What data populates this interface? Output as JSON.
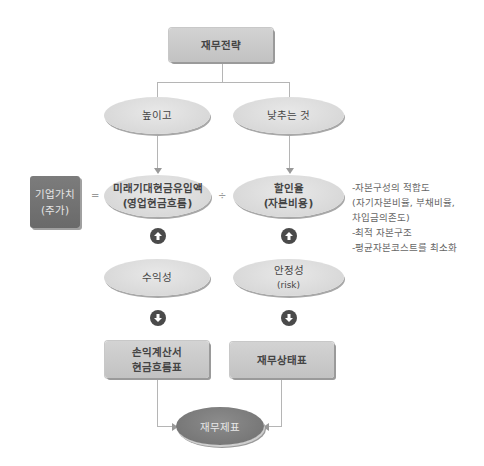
{
  "diagram": {
    "top": {
      "label": "재무전략"
    },
    "branches": {
      "left": {
        "label": "높이고"
      },
      "right": {
        "label": "낮추는 것"
      }
    },
    "equation": {
      "value_box": {
        "line1": "기업가치",
        "line2": "(주가)"
      },
      "equals": "=",
      "numerator": {
        "line1": "미래기대현금유입액",
        "line2": "(영업현금흐름)"
      },
      "divide": "÷",
      "denominator": {
        "line1": "할인율",
        "line2": "(자본비용)"
      }
    },
    "notes": [
      "-자본구성의 적합도",
      "(자기자본비율, 부채비율,",
      "차입금의존도)",
      "-최적 자본구조",
      "-평균자본코스트를 최소화"
    ],
    "factors": {
      "left": {
        "line1": "수익성"
      },
      "right": {
        "line1": "안정성",
        "line2": "(risk)"
      }
    },
    "statements": {
      "left": {
        "line1": "손익계산서",
        "line2": "현금흐름표"
      },
      "right": {
        "line1": "재무상태표"
      }
    },
    "bottom": {
      "label": "재무제표"
    },
    "icons": {
      "up_arrow": "circle-up-arrow",
      "down_arrow": "circle-down-arrow"
    },
    "colors": {
      "light_gray": "#d2d2d2",
      "dark_gray": "#757575",
      "line": "#b5b5b5",
      "arrow_circle": "#4a4a4a"
    }
  }
}
